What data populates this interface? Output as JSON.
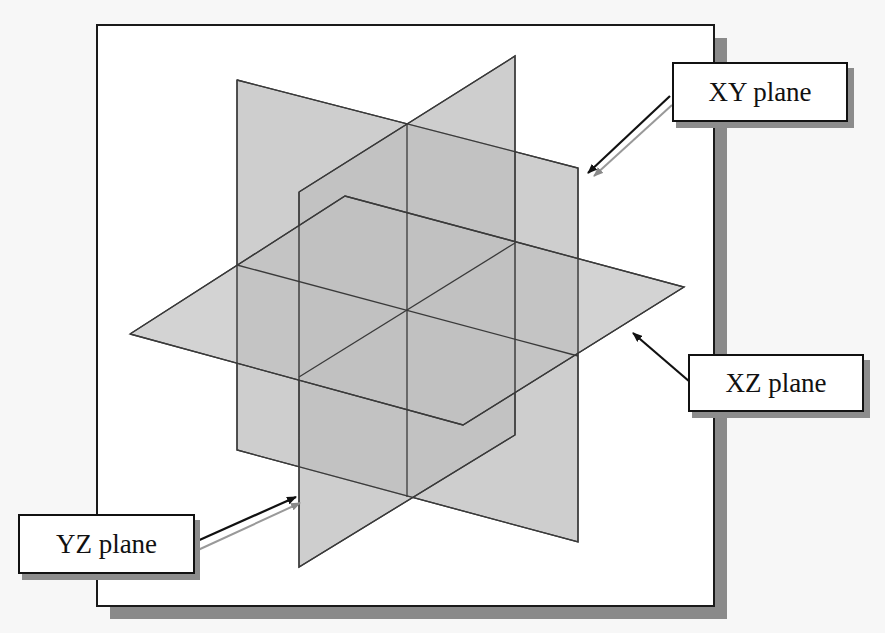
{
  "figure": {
    "colors": {
      "frame_border": "#1a1a1a",
      "frame_shadow": "#8a8a8a",
      "plane_fill": "#c4c4c4",
      "plane_overlap_fill": "#a9a9a9",
      "plane_edge": "#3a3a3a",
      "callout_border": "#111111"
    }
  },
  "labels": {
    "xy_plane": "XY plane",
    "xz_plane": "XZ plane",
    "yz_plane": "YZ plane"
  }
}
